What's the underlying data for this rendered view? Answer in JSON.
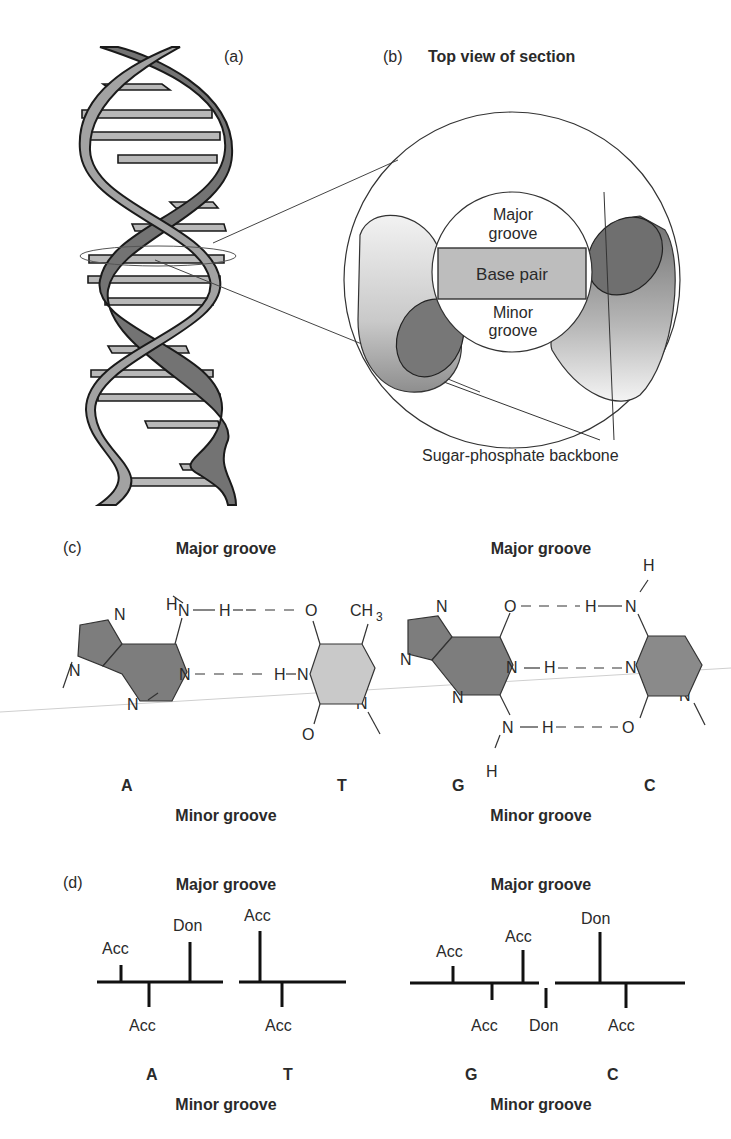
{
  "panel_a": {
    "label": "(a)"
  },
  "panel_b": {
    "label": "(b)",
    "title": "Top view of section",
    "major_groove": [
      "Major",
      "groove"
    ],
    "base_pair": "Base pair",
    "minor_groove": [
      "Minor",
      "groove"
    ],
    "backbone_label": "Sugar-phosphate backbone"
  },
  "panel_c": {
    "label": "(c)",
    "left": {
      "major_groove": "Major groove",
      "minor_groove": "Minor groove",
      "base1": "A",
      "base2": "T",
      "atoms": {
        "H_top": "H",
        "N_amine": "N",
        "H_bond1": "H",
        "O_top": "O",
        "CH3": "CH",
        "CH3_sub": "3",
        "N_ring1": "N",
        "N_ring2": "N",
        "N_ring3": "N",
        "N_ring4": "N",
        "H_bond2": "H",
        "N_T": "N",
        "N_T2": "N",
        "O_bottom": "O"
      }
    },
    "right": {
      "major_groove": "Major groove",
      "minor_groove": "Minor groove",
      "base1": "G",
      "base2": "C",
      "atoms": {
        "O_top": "O",
        "H_bond1": "H",
        "N_C_amine": "N",
        "H_C_top": "H",
        "N_ring1": "N",
        "N_ring2": "N",
        "N_ring3": "N",
        "N_G1": "N",
        "H_bond2": "H",
        "N_C1": "N",
        "N_C2": "N",
        "N_G_amine": "N",
        "H_bond3": "H",
        "O_C": "O",
        "H_G_bottom": "H"
      }
    }
  },
  "panel_d": {
    "label": "(d)",
    "left": {
      "major_groove": "Major groove",
      "minor_groove": "Minor groove",
      "base1": "A",
      "base2": "T",
      "a_major": [
        "Acc",
        "Don"
      ],
      "a_minor": [
        "Acc"
      ],
      "t_major": [
        "Acc"
      ],
      "t_minor": [
        "Acc"
      ]
    },
    "right": {
      "major_groove": "Major groove",
      "minor_groove": "Minor groove",
      "base1": "G",
      "base2": "C",
      "g_major": [
        "Acc",
        "Acc"
      ],
      "g_minor": [
        "Acc",
        "Don"
      ],
      "c_major": [
        "Don"
      ],
      "c_minor": [
        "Acc"
      ]
    }
  },
  "colors": {
    "strand_dark": "#6e6e6e",
    "strand_light": "#9a9a9a",
    "rung": "#b4b4b4",
    "purine": "#7d7d7d",
    "pyrimidine_T": "#c8c8c8",
    "pyrimidine_C": "#8a8a8a",
    "base_pair_box": "#bdbdbd"
  }
}
